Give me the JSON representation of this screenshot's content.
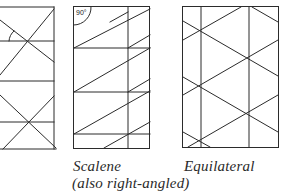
{
  "figure": {
    "stroke_color": "#2b2b2b",
    "background": "#ffffff",
    "panels": [
      {
        "id": "isosceles",
        "label": "",
        "note": "partially cropped at left edge; contains angle arc marker"
      },
      {
        "id": "scalene",
        "label": "Scalene",
        "sublabel": "(also right-angled)",
        "angle_marker": "90°"
      },
      {
        "id": "equilateral",
        "label": "Equilateral"
      }
    ]
  }
}
